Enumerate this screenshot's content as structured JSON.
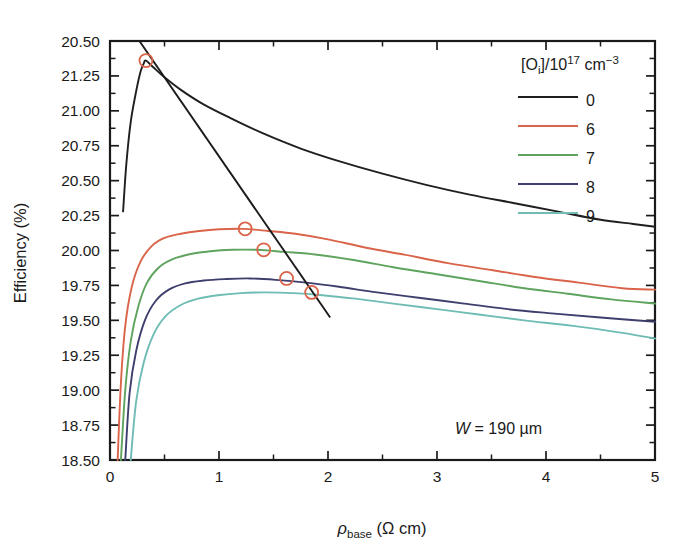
{
  "figure": {
    "background_color": "#ffffff",
    "annotation": {
      "text_italic": "W",
      "text_rest": " = 190 μm"
    }
  },
  "axes": {
    "y": {
      "label_text": "Efficiency (%)",
      "ticklabels": [
        "20.50",
        "21.25",
        "21.00",
        "20.75",
        "20.50",
        "20.25",
        "20.00",
        "19.75",
        "19.50",
        "19.25",
        "19.00",
        "18.75",
        "18.50"
      ],
      "values": [
        21.5,
        21.25,
        21.0,
        20.75,
        20.5,
        20.25,
        20.0,
        19.75,
        19.5,
        19.25,
        19.0,
        18.75,
        18.5
      ],
      "min": 18.5,
      "max": 21.5
    },
    "x": {
      "label_symbol": "ρ",
      "label_sub": "base",
      "label_unit": " (Ω cm)",
      "ticklabels": [
        "0",
        "1",
        "2",
        "3",
        "4",
        "5"
      ],
      "values": [
        0,
        1,
        2,
        3,
        4,
        5
      ],
      "min": 0,
      "max": 5
    }
  },
  "legend": {
    "title_prefix": "[O",
    "title_sub": "i",
    "title_mid": "]/10",
    "title_sup": "17",
    "title_unit": " cm",
    "title_unit_sup": "−3",
    "entries": [
      {
        "label": "0",
        "color": "#1f1f1f"
      },
      {
        "label": "6",
        "color": "#d9644a"
      },
      {
        "label": "7",
        "color": "#5ea35e"
      },
      {
        "label": "8",
        "color": "#3f3f6e"
      },
      {
        "label": "9",
        "color": "#6fbcb5"
      }
    ]
  },
  "chart_data": {
    "type": "line",
    "title": "",
    "xlabel": "ρ_base (Ω cm)",
    "ylabel": "Efficiency (%)",
    "xlim": [
      0,
      5
    ],
    "ylim": [
      18.5,
      21.5
    ],
    "grid": false,
    "legend_position": "upper-right",
    "legend_title": "[O_i]/10^17 cm^-3",
    "annotations": [
      "W = 190 μm"
    ],
    "series": [
      {
        "name": "0",
        "color": "#1f1f1f",
        "x": [
          0.12,
          0.15,
          0.19,
          0.24,
          0.28,
          0.31,
          0.33,
          0.4,
          0.5,
          0.65,
          0.85,
          1.1,
          1.4,
          1.75,
          2.1,
          2.5,
          2.9,
          3.3,
          3.7,
          4.1,
          4.5,
          4.8,
          5.0
        ],
        "y": [
          20.28,
          20.62,
          20.92,
          21.14,
          21.28,
          21.34,
          21.36,
          21.31,
          21.24,
          21.15,
          21.05,
          20.95,
          20.84,
          20.73,
          20.64,
          20.55,
          20.47,
          20.4,
          20.34,
          20.28,
          20.22,
          20.19,
          20.17
        ]
      },
      {
        "name": "6",
        "color": "#d9644a",
        "x": [
          0.07,
          0.1,
          0.14,
          0.2,
          0.28,
          0.38,
          0.5,
          0.65,
          0.82,
          1.0,
          1.22,
          1.45,
          1.7,
          2.0,
          2.35,
          2.7,
          3.1,
          3.5,
          3.9,
          4.3,
          4.7,
          5.0
        ],
        "y": [
          18.5,
          19.05,
          19.46,
          19.74,
          19.92,
          20.03,
          20.09,
          20.12,
          20.14,
          20.152,
          20.155,
          20.14,
          20.12,
          20.08,
          20.02,
          19.97,
          19.91,
          19.86,
          19.81,
          19.77,
          19.73,
          19.72
        ]
      },
      {
        "name": "7",
        "color": "#5ea35e",
        "x": [
          0.1,
          0.14,
          0.19,
          0.26,
          0.34,
          0.45,
          0.58,
          0.74,
          0.92,
          1.12,
          1.35,
          1.6,
          1.9,
          2.25,
          2.6,
          3.0,
          3.4,
          3.8,
          4.2,
          4.6,
          5.0
        ],
        "y": [
          18.5,
          19.0,
          19.35,
          19.6,
          19.77,
          19.88,
          19.94,
          19.975,
          19.995,
          20.005,
          20.005,
          19.99,
          19.97,
          19.93,
          19.88,
          19.83,
          19.78,
          19.73,
          19.69,
          19.65,
          19.62
        ]
      },
      {
        "name": "8",
        "color": "#3f3f6e",
        "x": [
          0.14,
          0.18,
          0.24,
          0.32,
          0.42,
          0.54,
          0.69,
          0.86,
          1.05,
          1.28,
          1.52,
          1.8,
          2.1,
          2.45,
          2.85,
          3.25,
          3.65,
          4.05,
          4.5,
          5.0
        ],
        "y": [
          18.5,
          18.98,
          19.28,
          19.5,
          19.64,
          19.72,
          19.765,
          19.785,
          19.795,
          19.8,
          19.79,
          19.77,
          19.74,
          19.7,
          19.66,
          19.62,
          19.58,
          19.55,
          19.52,
          19.49
        ]
      },
      {
        "name": "9",
        "color": "#6fbcb5",
        "x": [
          0.19,
          0.24,
          0.31,
          0.4,
          0.51,
          0.65,
          0.81,
          0.99,
          1.2,
          1.43,
          1.68,
          1.95,
          2.25,
          2.6,
          3.0,
          3.4,
          3.8,
          4.25,
          4.7,
          5.0
        ],
        "y": [
          18.5,
          18.92,
          19.2,
          19.4,
          19.53,
          19.61,
          19.655,
          19.68,
          19.695,
          19.7,
          19.695,
          19.68,
          19.655,
          19.62,
          19.58,
          19.54,
          19.5,
          19.46,
          19.41,
          19.37
        ]
      }
    ],
    "peak_trendline": {
      "name": "peak-locus",
      "color": "#1f1f1f",
      "marker_color": "#d9644a",
      "x": [
        0.33,
        1.24,
        1.41,
        1.62,
        1.85
      ],
      "y": [
        21.36,
        20.155,
        20.005,
        19.8,
        19.7
      ],
      "line_x": [
        0.27,
        2.02
      ],
      "line_y": [
        21.5,
        19.52
      ],
      "markers": [
        {
          "x": 0.33,
          "y": 21.36,
          "series": "0"
        },
        {
          "x": 1.24,
          "y": 20.155,
          "series": "6"
        },
        {
          "x": 1.41,
          "y": 20.005,
          "series": "7"
        },
        {
          "x": 1.62,
          "y": 19.8,
          "series": "8"
        },
        {
          "x": 1.85,
          "y": 19.7,
          "series": "9"
        }
      ]
    }
  }
}
